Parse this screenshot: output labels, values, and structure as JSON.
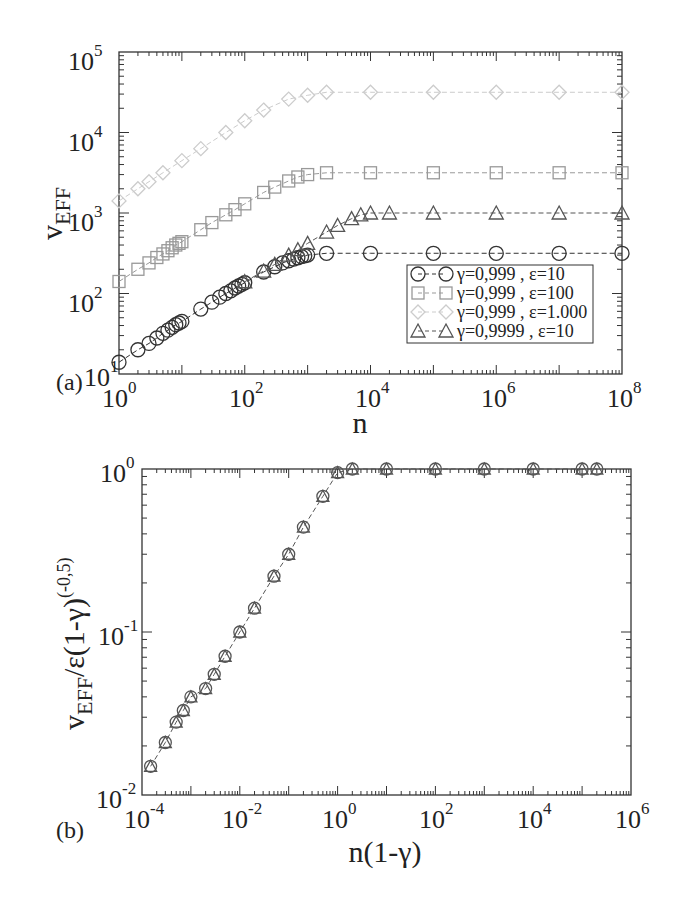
{
  "chart_data": [
    {
      "panel": "(a)",
      "type": "scatter",
      "xscale": "log",
      "yscale": "log",
      "xlabel": "n",
      "ylabel": "v_EFF",
      "xlim": [
        1,
        100000000
      ],
      "ylim": [
        10,
        100000
      ],
      "xticks": [
        "10^0",
        "10^2",
        "10^4",
        "10^6",
        "10^8"
      ],
      "yticks": [
        "10^1",
        "10^2",
        "10^3",
        "10^4",
        "10^5"
      ],
      "legend_position": "lower right",
      "grid": false,
      "series": [
        {
          "name": "γ=0,999 , ε=10",
          "marker": "circle",
          "color": "#333333",
          "x": [
            1,
            2,
            3,
            4,
            5,
            6,
            7,
            8,
            9,
            10,
            20,
            30,
            40,
            50,
            60,
            70,
            80,
            90,
            100,
            200,
            300,
            400,
            500,
            600,
            700,
            800,
            900,
            1000,
            2000,
            10000,
            100000,
            1000000,
            10000000,
            100000000
          ],
          "y": [
            14,
            20,
            24,
            28,
            32,
            35,
            38,
            41,
            43,
            45,
            64,
            78,
            90,
            100,
            108,
            117,
            124,
            130,
            136,
            185,
            215,
            240,
            255,
            268,
            278,
            287,
            294,
            300,
            316,
            316,
            316,
            316,
            316,
            316
          ]
        },
        {
          "name": "γ=0,999 , ε=100",
          "marker": "square",
          "color": "#999999",
          "x": [
            1,
            2,
            3,
            4,
            5,
            6,
            7,
            8,
            9,
            10,
            20,
            30,
            50,
            70,
            100,
            200,
            300,
            500,
            700,
            1000,
            2000,
            10000,
            100000,
            1000000,
            10000000,
            100000000
          ],
          "y": [
            141,
            200,
            240,
            280,
            310,
            340,
            370,
            400,
            420,
            440,
            620,
            760,
            950,
            1100,
            1300,
            1800,
            2100,
            2500,
            2800,
            3000,
            3160,
            3160,
            3160,
            3160,
            3160,
            3160
          ]
        },
        {
          "name": "γ=0,999 , ε=1.000",
          "marker": "diamond",
          "color": "#cccccc",
          "x": [
            1,
            2,
            3,
            5,
            10,
            20,
            50,
            100,
            200,
            500,
            1000,
            2000,
            10000,
            100000,
            1000000,
            10000000,
            100000000
          ],
          "y": [
            1414,
            2000,
            2450,
            3160,
            4470,
            6300,
            10000,
            14000,
            19000,
            26000,
            29000,
            31600,
            31600,
            31600,
            31600,
            31600,
            31600
          ]
        },
        {
          "name": "γ=0,9999 , ε=10",
          "marker": "triangle",
          "color": "#555555",
          "x": [
            100,
            200,
            300,
            500,
            700,
            1000,
            2000,
            3000,
            5000,
            7000,
            10000,
            20000,
            100000,
            1000000,
            10000000,
            100000000
          ],
          "y": [
            140,
            190,
            230,
            300,
            350,
            420,
            580,
            700,
            850,
            950,
            1000,
            1000,
            1000,
            1000,
            1000,
            1000
          ]
        }
      ]
    },
    {
      "panel": "(b)",
      "type": "scatter",
      "xscale": "log",
      "yscale": "log",
      "xlabel": "n(1-γ)",
      "ylabel": "v_EFF/ε(1-γ)^(-0,5)",
      "xlim": [
        0.0001,
        1000000
      ],
      "ylim": [
        0.01,
        1
      ],
      "xticks": [
        "10^-4",
        "10^-2",
        "10^0",
        "10^2",
        "10^4",
        "10^6"
      ],
      "yticks": [
        "10^-2",
        "10^-1",
        "10^0"
      ],
      "grid": false,
      "series": [
        {
          "name": "collapsed data (all series)",
          "marker": "mixed",
          "color": "#555555",
          "x": [
            0.00015,
            0.0003,
            0.0005,
            0.0007,
            0.001,
            0.002,
            0.003,
            0.005,
            0.01,
            0.02,
            0.05,
            0.1,
            0.2,
            0.5,
            1,
            2,
            10,
            100,
            1000,
            10000,
            100000,
            200000
          ],
          "y": [
            0.015,
            0.021,
            0.028,
            0.033,
            0.04,
            0.045,
            0.055,
            0.071,
            0.1,
            0.14,
            0.22,
            0.3,
            0.44,
            0.68,
            0.95,
            1,
            1,
            1,
            1,
            1,
            1,
            1
          ]
        }
      ]
    }
  ],
  "panel_a": {
    "label": "(a)",
    "xlabel": "n",
    "ylabel_main": "v",
    "ylabel_sub": "EFF",
    "xticks": [
      {
        "base": "10",
        "exp": "0"
      },
      {
        "base": "10",
        "exp": "2"
      },
      {
        "base": "10",
        "exp": "4"
      },
      {
        "base": "10",
        "exp": "6"
      },
      {
        "base": "10",
        "exp": "8"
      }
    ],
    "yticks": [
      {
        "base": "10",
        "exp": "1"
      },
      {
        "base": "10",
        "exp": "2"
      },
      {
        "base": "10",
        "exp": "3"
      },
      {
        "base": "10",
        "exp": "4"
      },
      {
        "base": "10",
        "exp": "5"
      }
    ],
    "legend": [
      {
        "label": "γ=0,999 , ε=10",
        "marker": "circle"
      },
      {
        "label": "γ=0,999 , ε=100",
        "marker": "square"
      },
      {
        "label": "γ=0,999 , ε=1.000",
        "marker": "diamond"
      },
      {
        "label": "γ=0,9999 , ε=10",
        "marker": "triangle"
      }
    ]
  },
  "panel_b": {
    "label": "(b)",
    "xlabel": "n(1-γ)",
    "ylabel_main": "v",
    "ylabel_sub": "EFF",
    "ylabel_rest": "/ε(1-γ)",
    "ylabel_sup": "(-0,5)",
    "xticks": [
      {
        "base": "10",
        "exp": "-4"
      },
      {
        "base": "10",
        "exp": "-2"
      },
      {
        "base": "10",
        "exp": "0"
      },
      {
        "base": "10",
        "exp": "2"
      },
      {
        "base": "10",
        "exp": "4"
      },
      {
        "base": "10",
        "exp": "6"
      }
    ],
    "yticks": [
      {
        "base": "10",
        "exp": "-2"
      },
      {
        "base": "10",
        "exp": "-1"
      },
      {
        "base": "10",
        "exp": "0"
      }
    ]
  },
  "colors": {
    "axis": "#333333",
    "circle": "#333333",
    "square": "#999999",
    "diamond": "#cccccc",
    "triangle": "#555555"
  }
}
